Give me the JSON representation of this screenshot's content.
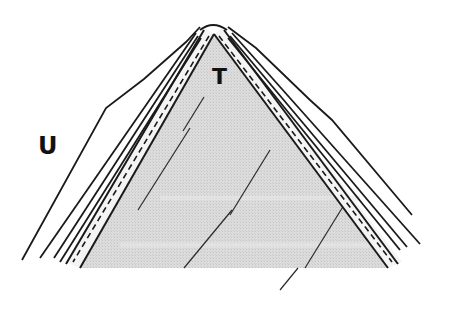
{
  "diagram": {
    "type": "cross-section",
    "labels": {
      "core": "T",
      "outer": "U"
    },
    "colors": {
      "background": "#ffffff",
      "core_fill": "#d9d9d9",
      "line": "#1a1a1a",
      "band_fill": "#f2f2f2"
    }
  }
}
